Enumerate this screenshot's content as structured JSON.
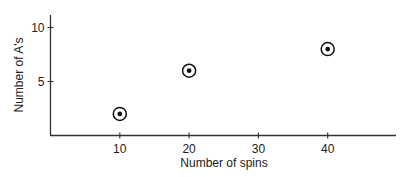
{
  "chart_data": {
    "type": "scatter",
    "title": "",
    "xlabel": "Number of spins",
    "ylabel": "Number of A's",
    "x_ticks": [
      10,
      20,
      30,
      40
    ],
    "y_ticks": [
      5,
      10
    ],
    "xlim": [
      0,
      50
    ],
    "ylim": [
      0,
      11
    ],
    "grid": false,
    "legend": null,
    "points": [
      {
        "x": 10,
        "y": 2
      },
      {
        "x": 20,
        "y": 6
      },
      {
        "x": 40,
        "y": 8
      }
    ],
    "marker": "circled-dot",
    "colors": {
      "axis": "#333333",
      "marker": "#111111",
      "text": "#222222"
    }
  }
}
